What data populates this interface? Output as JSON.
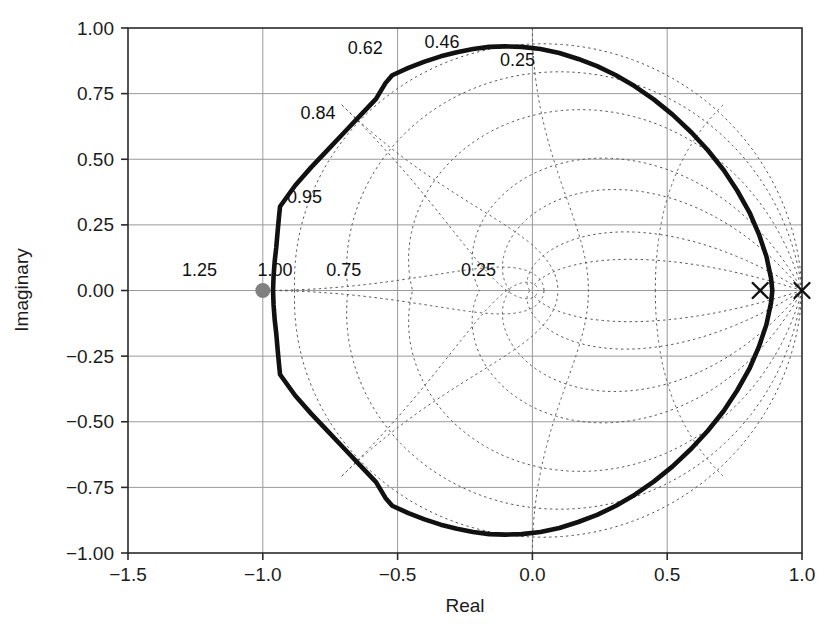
{
  "figure": {
    "kind": "root-locus-z-plane",
    "background_color": "#ffffff"
  },
  "chart_data": {
    "type": "line",
    "title": "",
    "subtitle": "",
    "xlabel": "Real",
    "ylabel": "Imaginary",
    "xlim": [
      -1.5,
      1.0
    ],
    "ylim": [
      -1.0,
      1.0
    ],
    "xticks": [
      -1.5,
      -1.0,
      -0.5,
      0.0,
      0.5,
      1.0
    ],
    "xticklabels": [
      "-1.5",
      "-1.0",
      "-0.5",
      "0.0",
      "0.5",
      "1.0"
    ],
    "yticks": [
      -1.0,
      -0.75,
      -0.5,
      -0.25,
      0.0,
      0.25,
      0.5,
      0.75,
      1.0
    ],
    "yticklabels": [
      "-1.00",
      "-0.75",
      "-0.50",
      "-0.25",
      "0.00",
      "0.25",
      "0.50",
      "0.75",
      "1.00"
    ],
    "grid": true,
    "legend": "none",
    "grid_color": "#9a9a9a",
    "locus_color": "#111111",
    "damping_grid_color": "#555555",
    "marker_color": "#111111",
    "closed_loop_marker_color": "#808080",
    "series": [
      {
        "name": "root locus branch",
        "style": "solid-thick",
        "closed": true,
        "points": [
          [
            -0.962,
            0.0
          ],
          [
            -0.96,
            0.055
          ],
          [
            -0.956,
            0.11
          ],
          [
            -0.95,
            0.165
          ],
          [
            -0.945,
            0.225
          ],
          [
            -0.94,
            0.28
          ],
          [
            -0.936,
            0.32
          ],
          [
            -0.88,
            0.4
          ],
          [
            -0.82,
            0.47
          ],
          [
            -0.76,
            0.535
          ],
          [
            -0.7,
            0.6
          ],
          [
            -0.64,
            0.665
          ],
          [
            -0.58,
            0.73
          ],
          [
            -0.545,
            0.79
          ],
          [
            -0.52,
            0.82
          ],
          [
            -0.46,
            0.848
          ],
          [
            -0.4,
            0.872
          ],
          [
            -0.34,
            0.892
          ],
          [
            -0.28,
            0.908
          ],
          [
            -0.22,
            0.92
          ],
          [
            -0.16,
            0.928
          ],
          [
            -0.1,
            0.93
          ],
          [
            -0.04,
            0.928
          ],
          [
            0.03,
            0.92
          ],
          [
            0.1,
            0.905
          ],
          [
            0.17,
            0.882
          ],
          [
            0.24,
            0.855
          ],
          [
            0.31,
            0.82
          ],
          [
            0.38,
            0.778
          ],
          [
            0.45,
            0.728
          ],
          [
            0.52,
            0.67
          ],
          [
            0.59,
            0.602
          ],
          [
            0.65,
            0.535
          ],
          [
            0.71,
            0.458
          ],
          [
            0.76,
            0.38
          ],
          [
            0.805,
            0.298
          ],
          [
            0.84,
            0.215
          ],
          [
            0.868,
            0.13
          ],
          [
            0.885,
            0.048
          ],
          [
            0.89,
            0.0
          ],
          [
            0.885,
            -0.048
          ],
          [
            0.868,
            -0.13
          ],
          [
            0.84,
            -0.215
          ],
          [
            0.805,
            -0.298
          ],
          [
            0.76,
            -0.38
          ],
          [
            0.71,
            -0.458
          ],
          [
            0.65,
            -0.535
          ],
          [
            0.59,
            -0.602
          ],
          [
            0.52,
            -0.67
          ],
          [
            0.45,
            -0.728
          ],
          [
            0.38,
            -0.778
          ],
          [
            0.31,
            -0.82
          ],
          [
            0.24,
            -0.855
          ],
          [
            0.17,
            -0.882
          ],
          [
            0.1,
            -0.905
          ],
          [
            0.03,
            -0.92
          ],
          [
            -0.04,
            -0.928
          ],
          [
            -0.1,
            -0.93
          ],
          [
            -0.16,
            -0.928
          ],
          [
            -0.22,
            -0.92
          ],
          [
            -0.28,
            -0.908
          ],
          [
            -0.34,
            -0.892
          ],
          [
            -0.4,
            -0.872
          ],
          [
            -0.46,
            -0.848
          ],
          [
            -0.52,
            -0.82
          ],
          [
            -0.545,
            -0.79
          ],
          [
            -0.58,
            -0.73
          ],
          [
            -0.64,
            -0.665
          ],
          [
            -0.7,
            -0.6
          ],
          [
            -0.76,
            -0.535
          ],
          [
            -0.82,
            -0.47
          ],
          [
            -0.88,
            -0.4
          ],
          [
            -0.936,
            -0.32
          ],
          [
            -0.94,
            -0.28
          ],
          [
            -0.945,
            -0.225
          ],
          [
            -0.95,
            -0.165
          ],
          [
            -0.956,
            -0.11
          ],
          [
            -0.96,
            -0.055
          ],
          [
            -0.962,
            0.0
          ]
        ]
      }
    ],
    "markers": [
      {
        "name": "open-loop-pole-1",
        "symbol": "x",
        "x": 0.845,
        "y": 0.0
      },
      {
        "name": "open-loop-pole-2",
        "symbol": "x",
        "x": 1.0,
        "y": 0.0
      },
      {
        "name": "selected-root",
        "symbol": "filled-circle",
        "x": -1.0,
        "y": 0.0
      }
    ],
    "damping_labels": [
      "0.95",
      "0.84",
      "0.62",
      "0.46",
      "0.25"
    ],
    "damping_ratios": [
      0.95,
      0.84,
      0.62,
      0.46,
      0.25,
      0.12,
      0.04
    ],
    "natural_frequency_labels": [
      "1.25",
      "1.00",
      "0.75",
      "0.25"
    ],
    "natural_frequencies": [
      0.25,
      0.5,
      0.75,
      1.0,
      1.25
    ],
    "annotations": [
      {
        "text": "0.62",
        "x": -0.62,
        "y": 0.9
      },
      {
        "text": "0.46",
        "x": -0.335,
        "y": 0.925
      },
      {
        "text": "0.25",
        "x": -0.055,
        "y": 0.855
      },
      {
        "text": "0.84",
        "x": -0.795,
        "y": 0.655
      },
      {
        "text": "0.95",
        "x": -0.845,
        "y": 0.335
      },
      {
        "text": "1.25",
        "x": -1.235,
        "y": 0.055
      },
      {
        "text": "1.00",
        "x": -0.955,
        "y": 0.055
      },
      {
        "text": "0.75",
        "x": -0.7,
        "y": 0.055
      },
      {
        "text": "0.25",
        "x": -0.2,
        "y": 0.055
      }
    ]
  },
  "caption": {
    "text": ""
  }
}
